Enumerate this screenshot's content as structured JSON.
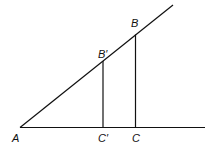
{
  "diagram": {
    "type": "similar-triangles",
    "labels": {
      "A": "A",
      "B": "B",
      "B_prime": "B′",
      "C": "C",
      "C_prime": "C′"
    },
    "colors": {
      "line": "#111111",
      "background": "#ffffff"
    }
  }
}
